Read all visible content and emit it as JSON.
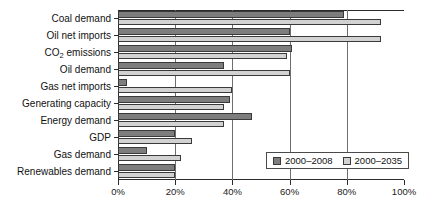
{
  "chart_data": {
    "type": "bar",
    "orientation": "horizontal",
    "title": "",
    "xlabel": "",
    "ylabel": "",
    "xlim": [
      0,
      100
    ],
    "xticks": [
      "0%",
      "20%",
      "40%",
      "60%",
      "80%",
      "100%"
    ],
    "xtick_values": [
      0,
      20,
      40,
      60,
      80,
      100
    ],
    "grid": true,
    "legend_position": "bottom-right",
    "categories": [
      "Coal demand",
      "Oil net imports",
      "CO2 emissions",
      "Oil demand",
      "Gas net imports",
      "Generating capacity",
      "Energy demand",
      "GDP",
      "Gas demand",
      "Renewables demand"
    ],
    "category_labels_html": [
      "Coal demand",
      "Oil net imports",
      "CO<sub>2</sub> emissions",
      "Oil demand",
      "Gas net imports",
      "Generating capacity",
      "Energy demand",
      "GDP",
      "Gas demand",
      "Renewables demand"
    ],
    "series": [
      {
        "name": "2000–2008",
        "color": "#7d7d7d",
        "values": [
          79,
          60,
          61,
          37,
          3,
          39,
          47,
          20,
          10,
          20
        ]
      },
      {
        "name": "2000–2035",
        "color": "#d2d2d2",
        "values": [
          92,
          92,
          59,
          60,
          40,
          37,
          37,
          26,
          22,
          20
        ]
      }
    ]
  },
  "legend": {
    "items": [
      {
        "label": "2000–2008"
      },
      {
        "label": "2000–2035"
      }
    ]
  }
}
